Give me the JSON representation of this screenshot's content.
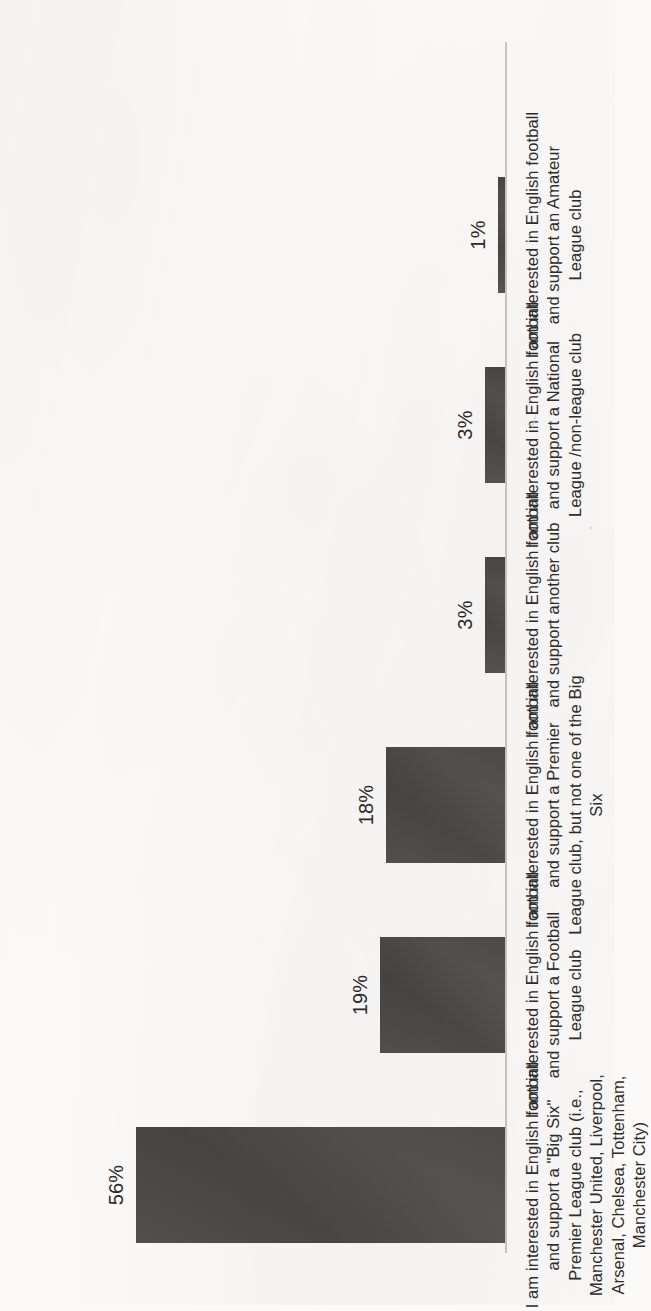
{
  "chart_data": {
    "type": "bar",
    "title": "",
    "subtitle": "",
    "xlabel": "",
    "ylabel": "",
    "ylim": [
      0,
      60
    ],
    "grid": false,
    "legend": false,
    "orientation": "vertical-bars-rotated-90ccw-on-page",
    "value_format": "percent",
    "bar_color": "#4c4a49",
    "axis_color": "#c9c6c2",
    "background_color": "#fbfaf8",
    "categories": [
      "I am interested in English football and support a \"Big Six\" Premier League club (i.e., Manchester United, Liverpool, Arsenal, Chelsea, Tottenham, Manchester City)",
      "I am interested in English football and support a Football League club",
      "I am interested in English football and support a Premier League club, but not one of the Big Six",
      "I am interested in English football and support another club",
      "I am interested in English football and support a National League /non-league club",
      "I am interested in English football and support an Amateur League club"
    ],
    "values": [
      56,
      19,
      18,
      3,
      3,
      1
    ],
    "value_labels": [
      "56%",
      "19%",
      "18%",
      "3%",
      "3%",
      "1%"
    ]
  },
  "chart": {
    "bars": [
      {
        "value_label": "56%",
        "label_line_1": "I am interested in English football and support a \"Big Six\"",
        "label_line_2": "Premier League club (i.e., Manchester United, Liverpool,",
        "label_line_3": "Arsenal, Chelsea, Tottenham, Manchester City)"
      },
      {
        "value_label": "19%",
        "label_line_1": "I am interested in English football and support a Football",
        "label_line_2": "League club",
        "label_line_3": ""
      },
      {
        "value_label": "18%",
        "label_line_1": "I am interested in English football and support a Premier",
        "label_line_2": "League club, but not one of the Big Six",
        "label_line_3": ""
      },
      {
        "value_label": "3%",
        "label_line_1": "I am interested in English football and support another club",
        "label_line_2": "",
        "label_line_3": ""
      },
      {
        "value_label": "3%",
        "label_line_1": "I am interested in English football and support a National",
        "label_line_2": "League /non-league club",
        "label_line_3": ""
      },
      {
        "value_label": "1%",
        "label_line_1": "I am interested in English football and support an Amateur",
        "label_line_2": "League club",
        "label_line_3": ""
      }
    ]
  }
}
